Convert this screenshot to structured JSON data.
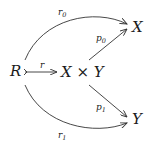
{
  "diagram": {
    "type": "commutative-diagram",
    "objects": {
      "R": "R",
      "XY": "X × Y",
      "X": "X",
      "Y": "Y"
    },
    "morphisms": [
      {
        "id": "r",
        "label": "r",
        "from": "R",
        "to": "X × Y",
        "style": "monomorphism"
      },
      {
        "id": "p0",
        "label": "p0",
        "from": "X × Y",
        "to": "X",
        "style": "straight"
      },
      {
        "id": "p1",
        "label": "p1",
        "from": "X × Y",
        "to": "Y",
        "style": "straight"
      },
      {
        "id": "r0",
        "label": "r0",
        "from": "R",
        "to": "X",
        "style": "curved-up"
      },
      {
        "id": "r1",
        "label": "r1",
        "from": "R",
        "to": "Y",
        "style": "curved-down"
      }
    ],
    "labels": {
      "r": "r",
      "p0_base": "p",
      "p0_sub": "0",
      "p1_base": "p",
      "p1_sub": "1",
      "r0_base": "r",
      "r0_sub": "0",
      "r1_base": "r",
      "r1_sub": "1"
    }
  }
}
